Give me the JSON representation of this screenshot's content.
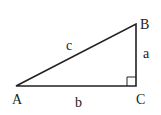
{
  "diagram": {
    "vertices": {
      "A": {
        "label": "A",
        "x": 16,
        "y": 86
      },
      "B": {
        "label": "B",
        "x": 136,
        "y": 24
      },
      "C": {
        "label": "C",
        "x": 136,
        "y": 86
      }
    },
    "sides": {
      "a": {
        "label": "a",
        "between": "B-C"
      },
      "b": {
        "label": "b",
        "between": "A-C"
      },
      "c": {
        "label": "c",
        "between": "A-B"
      }
    },
    "right_angle_at": "C",
    "line_color": "#222222"
  }
}
